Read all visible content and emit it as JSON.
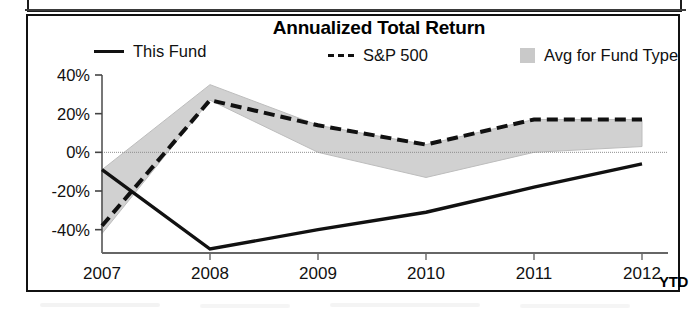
{
  "panel": {
    "title": "Annualized Total Return"
  },
  "legend": {
    "items": [
      {
        "label": "This Fund",
        "marker": "solid-line-swatch",
        "name": "legend-this-fund"
      },
      {
        "label": "S&P 500",
        "marker": "dashed-line-swatch",
        "name": "legend-sp-500"
      },
      {
        "label": "Avg for Fund Type",
        "marker": "shaded-band-swatch",
        "name": "legend-avg-fund-type"
      }
    ]
  },
  "axes": {
    "y_ticks": [
      "40%",
      "20%",
      "0%",
      "-20%",
      "-40%"
    ],
    "x_ticks": [
      "2007",
      "2008",
      "2009",
      "2010",
      "2011",
      "2012"
    ],
    "x_suffix": "YTD"
  },
  "colors": {
    "line": "#111111",
    "band": "#cfcfcf",
    "frame": "#111111",
    "background": "#ffffff"
  },
  "chart_data": {
    "type": "line",
    "title": "Annualized Total Return",
    "xlabel": "",
    "ylabel": "",
    "ylim": [
      -52,
      42
    ],
    "ytick_values": [
      40,
      20,
      0,
      -20,
      -40
    ],
    "ytick_labels": [
      "40%",
      "20%",
      "0%",
      "-20%",
      "-40%"
    ],
    "grid": false,
    "zero_line": true,
    "legend_position": "top",
    "categories": [
      "2007",
      "2008",
      "2009",
      "2010",
      "2011",
      "2012 YTD"
    ],
    "x": [
      2007,
      2008,
      2009,
      2010,
      2011,
      2012
    ],
    "series": [
      {
        "name": "This Fund",
        "style": "solid",
        "color": "#111111",
        "values": [
          -9,
          -50,
          -40,
          -31,
          -18,
          -6
        ]
      },
      {
        "name": "S&P 500",
        "style": "dashed",
        "color": "#111111",
        "values": [
          -38,
          27,
          14,
          4,
          17,
          17
        ]
      }
    ],
    "band": {
      "name": "Avg for Fund Type",
      "style": "shaded-area",
      "color": "#cfcfcf",
      "upper": [
        -9,
        35,
        14,
        4,
        17,
        17
      ],
      "lower": [
        -42,
        27,
        0,
        -13,
        0,
        3
      ]
    }
  }
}
